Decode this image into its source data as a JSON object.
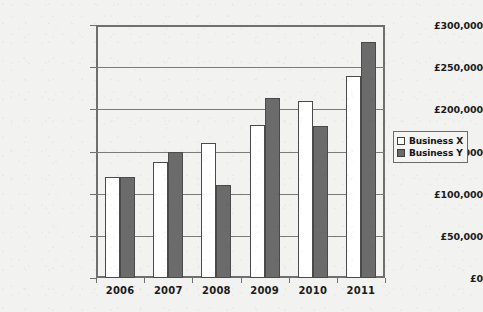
{
  "chart_data": {
    "type": "bar",
    "title": "",
    "xlabel": "",
    "ylabel": "",
    "categories": [
      "2006",
      "2007",
      "2008",
      "2009",
      "2010",
      "2011"
    ],
    "series": [
      {
        "name": "Business X",
        "color": "#ffffff",
        "values": [
          120000,
          138000,
          160000,
          182000,
          210000,
          240000
        ]
      },
      {
        "name": "Business Y",
        "color": "#6b6b6b",
        "values": [
          120000,
          150000,
          110000,
          214000,
          180000,
          280000
        ]
      }
    ],
    "ylim": [
      0,
      300000
    ],
    "ytick_values": [
      0,
      50000,
      100000,
      150000,
      200000,
      250000,
      300000
    ],
    "ytick_labels": [
      "£0",
      "£50,000",
      "£100,000",
      "£150,000",
      "£200,000",
      "£250,000",
      "£300,000"
    ],
    "grid": true,
    "legend_position": "right",
    "currency_symbol": "£"
  },
  "legend": {
    "entries": [
      {
        "label": "Business X",
        "swatch": "white-square"
      },
      {
        "label": "Business Y",
        "swatch": "gray-square"
      }
    ]
  },
  "colors": {
    "background": "#f2f2f0",
    "axis": "#6f6f6f",
    "grid": "#7a7a7a",
    "series_x": "#ffffff",
    "series_y": "#6b6b6b",
    "bar_outline": "#4a4a4a",
    "text": "#1b1b1b"
  }
}
